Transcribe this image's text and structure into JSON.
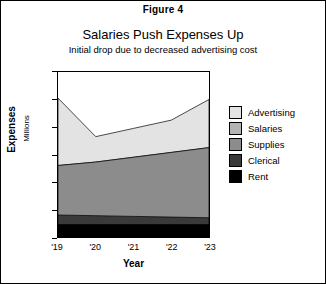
{
  "figure_label": "Figure 4",
  "title": "Salaries Push Expenses Up",
  "subtitle": "Initial drop due to decreased advertising cost",
  "axes": {
    "y_title": "Expenses",
    "y_subtitle": "Millions",
    "x_title": "Year"
  },
  "legend": {
    "items": [
      {
        "label": "Advertising",
        "color": "#e3e3e3"
      },
      {
        "label": "Salaries",
        "color": "#b4b4b4"
      },
      {
        "label": "Supplies",
        "color": "#8c8c8c"
      },
      {
        "label": "Clerical",
        "color": "#3a3a3a"
      },
      {
        "label": "Rent",
        "color": "#000000"
      }
    ]
  },
  "chart_data": {
    "type": "area",
    "title": "Salaries Push Expenses Up",
    "subtitle": "Initial drop due to decreased advertising cost",
    "xlabel": "Year",
    "ylabel": "Expenses",
    "ylabel_units": "Millions",
    "categories": [
      "'19",
      "'20",
      "'21",
      "'22",
      "'23"
    ],
    "x_tick_labels": [
      "'19",
      "'20",
      "'21",
      "'22",
      "'23"
    ],
    "y_tick_labels": [
      "0",
      "20",
      "40",
      "60",
      "80",
      "100",
      "120"
    ],
    "y_ticks": [
      0,
      20,
      40,
      60,
      80,
      100,
      120
    ],
    "ylim": [
      0,
      120
    ],
    "stacked": true,
    "grid": false,
    "legend_position": "right",
    "series": [
      {
        "name": "Rent",
        "color": "#000000",
        "values": [
          9,
          9,
          9,
          9,
          9
        ]
      },
      {
        "name": "Clerical",
        "color": "#3a3a3a",
        "values": [
          7,
          6.5,
          6,
          5.5,
          5
        ]
      },
      {
        "name": "Supplies",
        "color": "#8c8c8c",
        "values": [
          36,
          39,
          43,
          47,
          51
        ]
      },
      {
        "name": "Salaries",
        "color": "#b4b4b4",
        "values": [
          0,
          0,
          0,
          0,
          0
        ]
      },
      {
        "name": "Advertising",
        "color": "#e3e3e3",
        "values": [
          49,
          18.5,
          21,
          23.5,
          35
        ]
      }
    ],
    "cumulative_tops": {
      "Rent": [
        9,
        9,
        9,
        9,
        9
      ],
      "Clerical": [
        16,
        15.5,
        15,
        14.5,
        14
      ],
      "Supplies": [
        52,
        54.5,
        58,
        61.5,
        65
      ],
      "Salaries": [
        52,
        54.5,
        58,
        61.5,
        65
      ],
      "Advertising": [
        101,
        73,
        79,
        85,
        100
      ]
    },
    "totals": [
      101,
      73,
      79,
      85,
      100
    ]
  }
}
